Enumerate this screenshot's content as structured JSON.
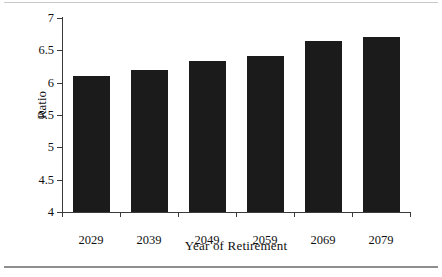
{
  "figure": {
    "background_color": "#ffffff",
    "rule_color": "#8e8e8e"
  },
  "axis_titles": {
    "x": "Year of Retirement",
    "y": "Ratio"
  },
  "chart_data": {
    "type": "bar",
    "title": "",
    "subtitle": "",
    "xlabel": "Year of Retirement",
    "ylabel": "Ratio",
    "categories": [
      "2029",
      "2039",
      "2049",
      "2059",
      "2069",
      "2079"
    ],
    "values": [
      6.11,
      6.2,
      6.33,
      6.42,
      6.65,
      6.71
    ],
    "series": [
      {
        "name": "Ratio",
        "values": [
          6.11,
          6.2,
          6.33,
          6.42,
          6.65,
          6.71
        ],
        "color": "#1b1b1b"
      }
    ],
    "ylim": [
      4,
      7
    ],
    "ytick_labels": [
      "4",
      "4.5",
      "5",
      "5.5",
      "6",
      "6.5",
      "7"
    ],
    "ytick_values": [
      4,
      4.5,
      5,
      5.5,
      6,
      6.5,
      7
    ],
    "xtick_labels": [
      "2029",
      "2039",
      "2049",
      "2059",
      "2069",
      "2079"
    ],
    "grid": false,
    "legend": null,
    "legend_position": "none",
    "bar_color": "#1b1b1b",
    "axis_color": "#3a3a3a",
    "annotations": []
  }
}
